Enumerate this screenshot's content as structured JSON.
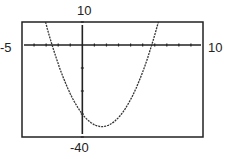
{
  "chart_data": {
    "type": "line",
    "title": "",
    "xlabel": "",
    "ylabel": "",
    "xlim": [
      -5,
      10
    ],
    "ylim": [
      -40,
      10
    ],
    "window_labels": {
      "xmin": "-5",
      "xmax": "10",
      "ymin": "-40",
      "ymax": "10"
    },
    "grid": false,
    "x_tick_step": 1,
    "y_tick_step": 10,
    "series": [
      {
        "name": "parabola",
        "x": [
          -3.5,
          -3,
          -2.5,
          -2,
          -1,
          0,
          1,
          1.6,
          2,
          3,
          4,
          5,
          5.75,
          6,
          7
        ],
        "values": [
          17.25,
          7.5,
          -1.25,
          -9,
          -21.5,
          -30,
          -34.5,
          -35.3,
          -35,
          -31.5,
          -24,
          -12.5,
          -1.3,
          3,
          22.5
        ]
      }
    ],
    "annotations": {
      "y_intercept": -30,
      "vertex": [
        1.6,
        -35.3
      ],
      "roots": [
        -2.5,
        5.75
      ]
    }
  }
}
